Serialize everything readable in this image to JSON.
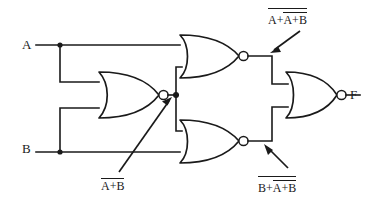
{
  "diagram": {
    "stroke_color": "#1a1a1a",
    "background_color": "#ffffff"
  },
  "inputs": [
    {
      "id": "a",
      "label": "A"
    },
    {
      "id": "b",
      "label": "B"
    }
  ],
  "outputs": [
    {
      "id": "f",
      "label": "F"
    }
  ],
  "signal_labels": {
    "nor1_out": {
      "inner": "A+B",
      "overbar": true
    },
    "nor2_out": {
      "term1": "A",
      "inner": "A+B",
      "plus": "+",
      "overbar": true
    },
    "nor3_out": {
      "term1": "B",
      "inner": "A+B",
      "plus": "+",
      "overbar": true
    }
  },
  "gates": [
    {
      "id": "nor1",
      "type": "NOR",
      "inputs": [
        "A",
        "B"
      ],
      "output": "nor1_out"
    },
    {
      "id": "nor2",
      "type": "NOR",
      "inputs": [
        "A",
        "nor1_out"
      ],
      "output": "nor2_out"
    },
    {
      "id": "nor3",
      "type": "NOR",
      "inputs": [
        "nor1_out",
        "B"
      ],
      "output": "nor3_out"
    },
    {
      "id": "nor4",
      "type": "NOR",
      "inputs": [
        "nor2_out",
        "nor3_out"
      ],
      "output": "F"
    }
  ],
  "annotations": [
    {
      "id": "ann-nor1",
      "target": "nor1_out",
      "direction": "up-right"
    },
    {
      "id": "ann-nor2",
      "target": "nor2_out",
      "direction": "down-left"
    },
    {
      "id": "ann-nor3",
      "target": "nor3_out",
      "direction": "up-left"
    }
  ]
}
